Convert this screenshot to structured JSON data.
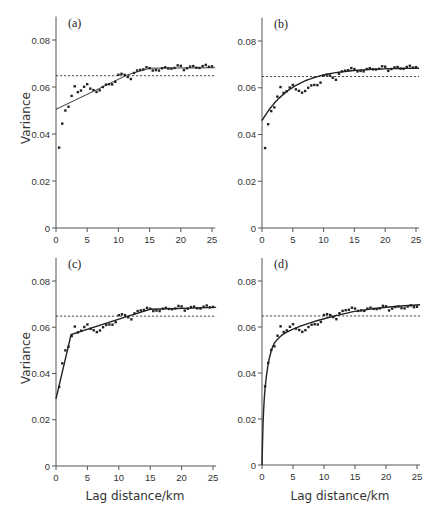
{
  "figure": {
    "ylabel": "Variance",
    "xlabel": "Lag distance/km",
    "colors": {
      "axis": "#555555",
      "points": "#222222",
      "fit": "#222222",
      "sill": "#333333",
      "background": "#ffffff"
    }
  },
  "chart_data": [
    {
      "type": "scatter",
      "panel": "(a)",
      "title": "(a)",
      "xlabel": "",
      "ylabel": "Variance",
      "xlim": [
        0,
        25.5
      ],
      "ylim": [
        0,
        0.09
      ],
      "xticks": [
        0,
        5,
        10,
        15,
        20,
        25
      ],
      "yticks": [
        0,
        0.02,
        0.04,
        0.06,
        0.08
      ],
      "ytick_labels": [
        "0",
        "0.02",
        "0.04",
        "0.06",
        "0.08"
      ],
      "grid": false,
      "sill_dashed": 0.0648,
      "fit_model": "linear with sill",
      "fit": {
        "x": [
          0,
          11.5,
          15,
          25.5
        ],
        "y": [
          0.0505,
          0.0652,
          0.068,
          0.0682
        ]
      },
      "series": [
        {
          "name": "experimental variogram",
          "x": [
            0.5,
            1,
            1.5,
            2,
            2.5,
            3,
            3.5,
            4,
            4.5,
            5,
            5.5,
            6,
            6.5,
            7,
            7.5,
            8,
            8.5,
            9,
            9.5,
            10,
            10.5,
            11,
            11.5,
            12,
            12.5,
            13,
            13.5,
            14,
            14.5,
            15,
            15.5,
            16,
            16.5,
            17,
            17.5,
            18,
            18.5,
            19,
            19.5,
            20,
            20.5,
            21,
            21.5,
            22,
            22.5,
            23,
            23.5,
            24,
            24.5,
            25
          ],
          "y": [
            0.0342,
            0.0444,
            0.05,
            0.0516,
            0.0562,
            0.0603,
            0.0578,
            0.0585,
            0.0601,
            0.0612,
            0.0593,
            0.0587,
            0.0579,
            0.0586,
            0.06,
            0.061,
            0.0612,
            0.0611,
            0.0622,
            0.0652,
            0.0656,
            0.0652,
            0.0643,
            0.0634,
            0.066,
            0.067,
            0.0673,
            0.0675,
            0.0684,
            0.068,
            0.067,
            0.0672,
            0.067,
            0.068,
            0.0684,
            0.0679,
            0.0678,
            0.0681,
            0.0692,
            0.069,
            0.0672,
            0.068,
            0.0687,
            0.0689,
            0.0682,
            0.0681,
            0.0689,
            0.0694,
            0.0686,
            0.0688
          ]
        }
      ]
    },
    {
      "type": "scatter",
      "panel": "(b)",
      "title": "(b)",
      "xlabel": "",
      "ylabel": "",
      "xlim": [
        0,
        25.5
      ],
      "ylim": [
        0,
        0.09
      ],
      "xticks": [
        0,
        5,
        10,
        15,
        20,
        25
      ],
      "yticks": [
        0,
        0.02,
        0.04,
        0.06,
        0.08
      ],
      "ytick_labels": [
        "0",
        "0.02",
        "0.04",
        "0.06",
        "0.08"
      ],
      "grid": false,
      "sill_dashed": 0.0648,
      "fit_model": "exponential",
      "fit": {
        "nugget": 0.0459,
        "sill": 0.0685,
        "range": 5.0
      },
      "series": [
        {
          "name": "experimental variogram",
          "x": [
            0.5,
            1,
            1.5,
            2,
            2.5,
            3,
            3.5,
            4,
            4.5,
            5,
            5.5,
            6,
            6.5,
            7,
            7.5,
            8,
            8.5,
            9,
            9.5,
            10,
            10.5,
            11,
            11.5,
            12,
            12.5,
            13,
            13.5,
            14,
            14.5,
            15,
            15.5,
            16,
            16.5,
            17,
            17.5,
            18,
            18.5,
            19,
            19.5,
            20,
            20.5,
            21,
            21.5,
            22,
            22.5,
            23,
            23.5,
            24,
            24.5,
            25
          ],
          "y": [
            0.0342,
            0.0444,
            0.05,
            0.0516,
            0.0562,
            0.0603,
            0.0578,
            0.0585,
            0.0601,
            0.0612,
            0.0593,
            0.0587,
            0.0579,
            0.0586,
            0.06,
            0.061,
            0.0612,
            0.0611,
            0.0622,
            0.0652,
            0.0656,
            0.0652,
            0.0643,
            0.0634,
            0.066,
            0.067,
            0.0673,
            0.0675,
            0.0684,
            0.068,
            0.067,
            0.0672,
            0.067,
            0.068,
            0.0684,
            0.0679,
            0.0678,
            0.0681,
            0.0692,
            0.069,
            0.0672,
            0.068,
            0.0687,
            0.0689,
            0.0682,
            0.0681,
            0.0689,
            0.0694,
            0.0686,
            0.0688
          ]
        }
      ]
    },
    {
      "type": "scatter",
      "panel": "(c)",
      "title": "(c)",
      "xlabel": "Lag distance/km",
      "ylabel": "Variance",
      "xlim": [
        0,
        25.5
      ],
      "ylim": [
        0,
        0.09
      ],
      "xticks": [
        0,
        5,
        10,
        15,
        20,
        25
      ],
      "yticks": [
        0,
        0.02,
        0.04,
        0.06,
        0.08
      ],
      "ytick_labels": [
        "0",
        "0.02",
        "0.04",
        "0.06",
        "0.08"
      ],
      "grid": false,
      "sill_dashed": 0.0648,
      "fit_model": "double spherical / nested linear",
      "fit": {
        "x": [
          0,
          2.4,
          11.5,
          15,
          25.5
        ],
        "y": [
          0.029,
          0.0568,
          0.0648,
          0.0678,
          0.0686
        ]
      },
      "series": [
        {
          "name": "experimental variogram",
          "x": [
            0.5,
            1,
            1.5,
            2,
            2.5,
            3,
            3.5,
            4,
            4.5,
            5,
            5.5,
            6,
            6.5,
            7,
            7.5,
            8,
            8.5,
            9,
            9.5,
            10,
            10.5,
            11,
            11.5,
            12,
            12.5,
            13,
            13.5,
            14,
            14.5,
            15,
            15.5,
            16,
            16.5,
            17,
            17.5,
            18,
            18.5,
            19,
            19.5,
            20,
            20.5,
            21,
            21.5,
            22,
            22.5,
            23,
            23.5,
            24,
            24.5,
            25
          ],
          "y": [
            0.0342,
            0.0444,
            0.05,
            0.0516,
            0.0562,
            0.0603,
            0.0578,
            0.0585,
            0.0601,
            0.0612,
            0.0593,
            0.0587,
            0.0579,
            0.0586,
            0.06,
            0.061,
            0.0612,
            0.0611,
            0.0622,
            0.0652,
            0.0656,
            0.0652,
            0.0643,
            0.0634,
            0.066,
            0.067,
            0.0673,
            0.0675,
            0.0684,
            0.068,
            0.067,
            0.0672,
            0.067,
            0.068,
            0.0684,
            0.0679,
            0.0678,
            0.0681,
            0.0692,
            0.069,
            0.0672,
            0.068,
            0.0687,
            0.0689,
            0.0682,
            0.0681,
            0.0689,
            0.0694,
            0.0686,
            0.0688
          ]
        }
      ]
    },
    {
      "type": "scatter",
      "panel": "(d)",
      "title": "(d)",
      "xlabel": "Lag distance/km",
      "ylabel": "",
      "xlim": [
        0,
        25.5
      ],
      "ylim": [
        0,
        0.09
      ],
      "xticks": [
        0,
        5,
        10,
        15,
        20,
        25
      ],
      "yticks": [
        0,
        0.02,
        0.04,
        0.06,
        0.08
      ],
      "ytick_labels": [
        "0",
        "0.02",
        "0.04",
        "0.06",
        "0.08"
      ],
      "grid": false,
      "sill_dashed": 0.0648,
      "fit_model": "steep nested model through origin",
      "fit": {
        "x": [
          0,
          0.2,
          0.5,
          1,
          1.5,
          2,
          3,
          4,
          6,
          8,
          10,
          12,
          15,
          18,
          21,
          25.5
        ],
        "y": [
          0.0,
          0.02,
          0.0335,
          0.044,
          0.0497,
          0.053,
          0.056,
          0.0578,
          0.0602,
          0.062,
          0.0636,
          0.065,
          0.0668,
          0.068,
          0.0688,
          0.0697
        ]
      },
      "series": [
        {
          "name": "experimental variogram",
          "x": [
            0.5,
            1,
            1.5,
            2,
            2.5,
            3,
            3.5,
            4,
            4.5,
            5,
            5.5,
            6,
            6.5,
            7,
            7.5,
            8,
            8.5,
            9,
            9.5,
            10,
            10.5,
            11,
            11.5,
            12,
            12.5,
            13,
            13.5,
            14,
            14.5,
            15,
            15.5,
            16,
            16.5,
            17,
            17.5,
            18,
            18.5,
            19,
            19.5,
            20,
            20.5,
            21,
            21.5,
            22,
            22.5,
            23,
            23.5,
            24,
            24.5,
            25
          ],
          "y": [
            0.0342,
            0.0444,
            0.05,
            0.0516,
            0.0562,
            0.0603,
            0.0578,
            0.0585,
            0.0601,
            0.0612,
            0.0593,
            0.0587,
            0.0579,
            0.0586,
            0.06,
            0.061,
            0.0612,
            0.0611,
            0.0622,
            0.0652,
            0.0656,
            0.0652,
            0.0643,
            0.0634,
            0.066,
            0.067,
            0.0673,
            0.0675,
            0.0684,
            0.068,
            0.067,
            0.0672,
            0.067,
            0.068,
            0.0684,
            0.0679,
            0.0678,
            0.0681,
            0.0692,
            0.069,
            0.0672,
            0.068,
            0.0687,
            0.0689,
            0.0682,
            0.0681,
            0.0689,
            0.0694,
            0.0686,
            0.0688
          ]
        }
      ]
    }
  ]
}
